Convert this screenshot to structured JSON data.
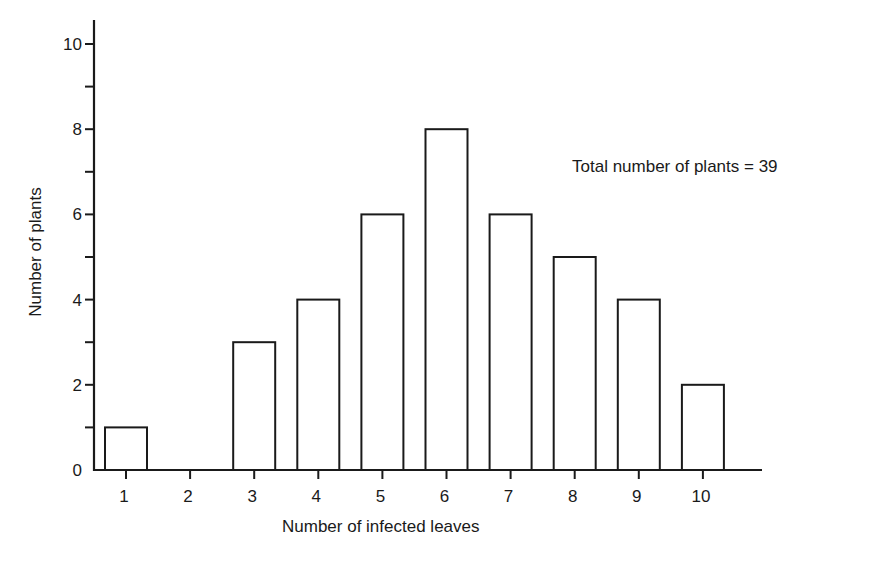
{
  "chart_data": {
    "type": "bar",
    "title": "",
    "xlabel": "Number of infected leaves",
    "ylabel": "Number of plants",
    "categories": [
      "1",
      "2",
      "3",
      "4",
      "5",
      "6",
      "7",
      "8",
      "9",
      "10"
    ],
    "values": [
      1,
      0,
      3,
      4,
      6,
      8,
      6,
      5,
      4,
      2
    ],
    "ylim": [
      0,
      10
    ],
    "yticks_major": [
      0,
      2,
      4,
      6,
      8,
      10
    ],
    "yticks_minor": [
      1,
      3,
      5,
      7,
      9
    ],
    "grid": false,
    "legend": null,
    "annotations": [
      "Total number of plants = 39"
    ],
    "bar_style": {
      "fill": "#ffffff",
      "stroke": "#1a1a1a"
    }
  },
  "annotation": "Total number of plants = 39",
  "xlabel": "Number of infected leaves",
  "ylabel": "Number of plants"
}
